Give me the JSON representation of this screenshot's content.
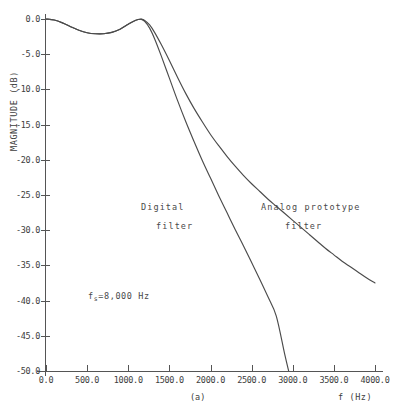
{
  "figure": {
    "caption": "(a)",
    "background": "#ffffff",
    "line_color": "#4b4b4b",
    "axis_color": "#555555",
    "text_color": "#3d3d3d"
  },
  "annotations": {
    "digital_line1": "Digital",
    "digital_line2": "filter",
    "analog_line1": "Analog prototype",
    "analog_line2": "filter",
    "sampling_prefix": "f",
    "sampling_subscript": "s",
    "sampling_value": "=8,000 Hz"
  },
  "chart_data": {
    "type": "line",
    "title": "",
    "xlabel": "f (Hz)",
    "ylabel": "MAGNITUDE (dB)",
    "xlim": [
      0.0,
      4000.0
    ],
    "ylim": [
      -50.0,
      0.0
    ],
    "grid": false,
    "legend": "inline-annotations",
    "xticks": [
      0.0,
      500.0,
      1000.0,
      1500.0,
      2000.0,
      2500.0,
      3000.0,
      3500.0,
      4000.0
    ],
    "xticklabels": [
      "0.0",
      "500.0",
      "1000.0",
      "1500.0",
      "2000.0",
      "2500.0",
      "3000.0",
      "3500.0",
      "4000.0"
    ],
    "yticks": [
      0.0,
      -5.0,
      -10.0,
      -15.0,
      -20.0,
      -25.0,
      -30.0,
      -35.0,
      -40.0,
      -45.0,
      -50.0
    ],
    "yticklabels": [
      "0.0",
      "-5.0",
      "-10.0",
      "-15.0",
      "-20.0",
      "-25.0",
      "-30.0",
      "-35.0",
      "-40.0",
      "-45.0",
      "-50.0"
    ],
    "series": [
      {
        "name": "Analog prototype filter",
        "x": [
          0,
          100,
          200,
          300,
          400,
          500,
          600,
          700,
          800,
          900,
          1000,
          1060,
          1120,
          1160,
          1200,
          1260,
          1320,
          1400,
          1500,
          1600,
          1700,
          1800,
          1900,
          2000,
          2100,
          2200,
          2300,
          2400,
          2500,
          2600,
          2700,
          2800,
          2900,
          3000,
          3100,
          3200,
          3300,
          3400,
          3500,
          3600,
          3700,
          3800,
          3900,
          4000
        ],
        "y": [
          0.0,
          -0.15,
          -0.55,
          -1.1,
          -1.6,
          -1.95,
          -2.1,
          -2.1,
          -1.9,
          -1.45,
          -0.75,
          -0.35,
          -0.08,
          -0.02,
          -0.2,
          -0.85,
          -1.9,
          -3.6,
          -5.9,
          -8.3,
          -10.6,
          -12.7,
          -14.6,
          -16.4,
          -18.0,
          -19.5,
          -20.9,
          -22.2,
          -23.4,
          -24.5,
          -25.6,
          -26.6,
          -27.6,
          -28.6,
          -29.6,
          -30.6,
          -31.6,
          -32.6,
          -33.5,
          -34.4,
          -35.2,
          -36.0,
          -36.8,
          -37.5
        ]
      },
      {
        "name": "Digital filter",
        "x": [
          0,
          100,
          200,
          300,
          400,
          500,
          600,
          700,
          800,
          900,
          1000,
          1060,
          1120,
          1160,
          1200,
          1260,
          1320,
          1400,
          1500,
          1600,
          1700,
          1800,
          1900,
          2000,
          2100,
          2200,
          2300,
          2400,
          2500,
          2600,
          2700,
          2800,
          2900,
          2950
        ],
        "y": [
          0.0,
          -0.15,
          -0.55,
          -1.1,
          -1.6,
          -1.95,
          -2.1,
          -2.1,
          -1.9,
          -1.45,
          -0.75,
          -0.35,
          -0.08,
          -0.05,
          -0.35,
          -1.3,
          -2.8,
          -5.2,
          -8.4,
          -11.6,
          -14.6,
          -17.4,
          -20.1,
          -22.6,
          -25.1,
          -27.5,
          -29.9,
          -32.2,
          -34.6,
          -37.0,
          -39.5,
          -42.2,
          -47.5,
          -50.0
        ]
      }
    ]
  }
}
